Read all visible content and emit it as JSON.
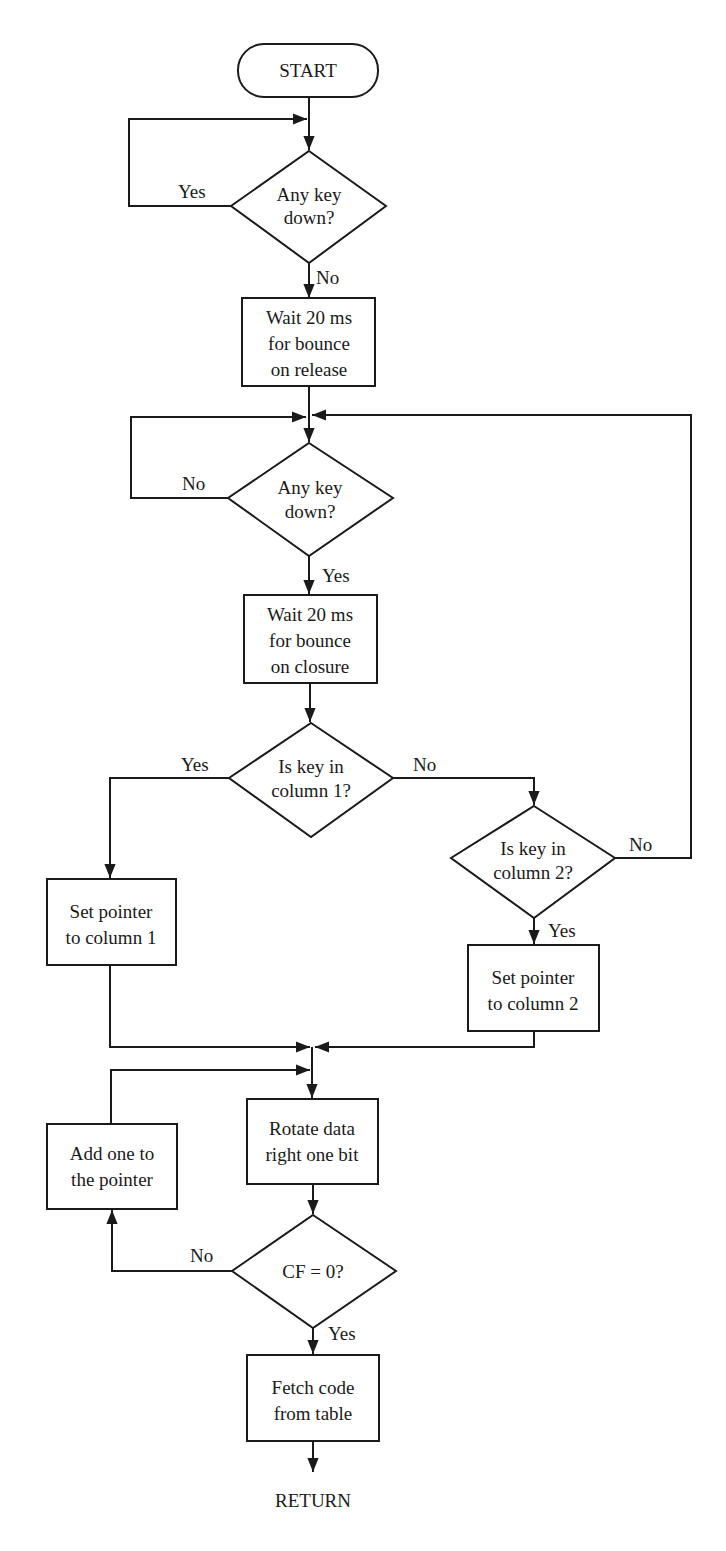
{
  "colors": {
    "stroke": "#1a1a1a",
    "background": "#ffffff"
  },
  "nodes": {
    "start": {
      "label": "START"
    },
    "decision_release": {
      "line1": "Any key",
      "line2": "down?"
    },
    "wait_release": {
      "line1": "Wait 20 ms",
      "line2": "for bounce",
      "line3": "on release"
    },
    "decision_press": {
      "line1": "Any key",
      "line2": "down?"
    },
    "wait_closure": {
      "line1": "Wait 20 ms",
      "line2": "for bounce",
      "line3": "on closure"
    },
    "decision_col1": {
      "line1": "Is key in",
      "line2": "column 1?"
    },
    "decision_col2": {
      "line1": "Is key in",
      "line2": "column 2?"
    },
    "set_col1": {
      "line1": "Set pointer",
      "line2": "to column 1"
    },
    "set_col2": {
      "line1": "Set pointer",
      "line2": "to column 2"
    },
    "rotate": {
      "line1": "Rotate data",
      "line2": "right one bit"
    },
    "add_one": {
      "line1": "Add one to",
      "line2": "the pointer"
    },
    "decision_cf": {
      "line1": "CF = 0?"
    },
    "fetch": {
      "line1": "Fetch code",
      "line2": "from table"
    },
    "return": {
      "label": "RETURN"
    }
  },
  "edge_labels": {
    "release_yes": "Yes",
    "release_no": "No",
    "press_no": "No",
    "press_yes": "Yes",
    "col1_yes": "Yes",
    "col1_no": "No",
    "col2_no": "No",
    "col2_yes": "Yes",
    "cf_no": "No",
    "cf_yes": "Yes"
  }
}
